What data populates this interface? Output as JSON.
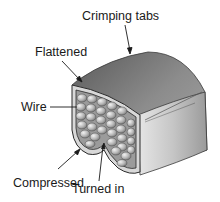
{
  "figure": {
    "labels": {
      "crimping_tabs": "Crimping tabs",
      "flattened": "Flattened",
      "wire": "Wire",
      "compressed": "Compressed",
      "turned_in": "Turned in"
    }
  },
  "colors": {
    "background": "#ffffff",
    "text": "#1a1a1a",
    "terminal_body": "#8a8a8a",
    "wire_strands": "#bdbdbd"
  }
}
